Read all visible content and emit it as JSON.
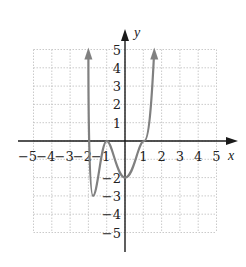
{
  "chart_data": {
    "type": "line",
    "title": "",
    "xlabel": "x",
    "ylabel": "y",
    "xlim": [
      -5,
      5
    ],
    "ylim": [
      -5,
      5
    ],
    "grid": true,
    "x_ticks": [
      "-5",
      "-4",
      "-3",
      "-2",
      "-1",
      "1",
      "2",
      "3",
      "4",
      "5"
    ],
    "y_ticks": [
      "5",
      "4",
      "3",
      "2",
      "1",
      "-2",
      "-3",
      "-4",
      "-5"
    ],
    "series": [
      {
        "name": "polynomial",
        "color": "#808080",
        "points": [
          [
            -2,
            4.9
          ],
          [
            -2,
            0
          ],
          [
            -1.75,
            -3
          ],
          [
            -1,
            0
          ],
          [
            0,
            -2
          ],
          [
            1,
            0
          ],
          [
            1.6,
            4.9
          ]
        ],
        "arrows": "both-ends-up"
      }
    ]
  },
  "colors": {
    "curve": "#808080",
    "axis": "#1a1a1a",
    "grid": "#bdbdbd"
  }
}
